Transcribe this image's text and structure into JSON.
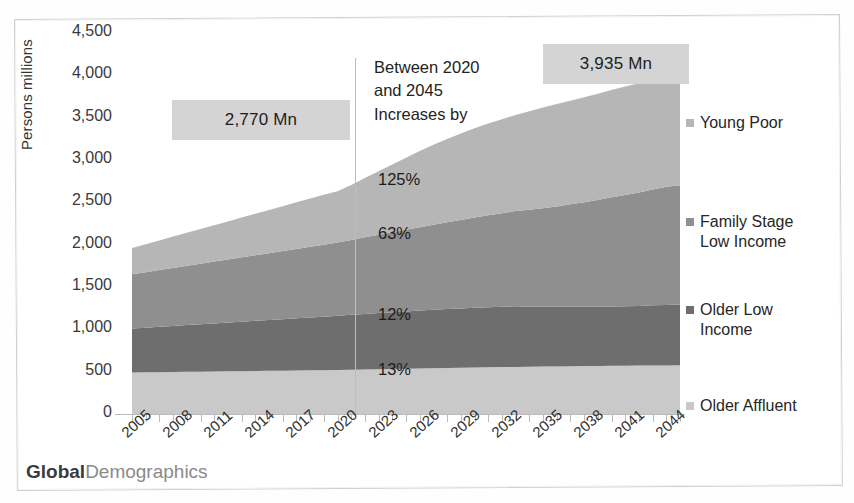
{
  "brand": {
    "bold": "Global",
    "light": "Demographics"
  },
  "callouts": [
    {
      "id": "start-total",
      "text": "2,770 Mn"
    },
    {
      "id": "end-total",
      "text": "3,935 Mn"
    }
  ],
  "annotation": {
    "line1": "Between 2020",
    "line2": "and 2045",
    "line3": "Increases by"
  },
  "legend": {
    "items": [
      {
        "label": "Young Poor",
        "color": "#b6b6b6"
      },
      {
        "label": "Family Stage Low Income",
        "color": "#8f8f8f"
      },
      {
        "label": "Older Low Income",
        "color": "#6e6e6e"
      },
      {
        "label": "Older Affluent",
        "color": "#c9c9c9"
      }
    ]
  },
  "chart_data": {
    "type": "area",
    "stacked": true,
    "title": "",
    "xlabel": "",
    "ylabel": "Persons millions",
    "ylim": [
      0,
      4500
    ],
    "ytick_labels": [
      "4,500",
      "4,000",
      "3,500",
      "3,000",
      "2,500",
      "2,000",
      "1,500",
      "1,000",
      "500",
      "0"
    ],
    "ytick_values": [
      4500,
      4000,
      3500,
      3000,
      2500,
      2000,
      1500,
      1000,
      500,
      0
    ],
    "grid": false,
    "legend_position": "right",
    "x": [
      2005,
      2006,
      2007,
      2008,
      2009,
      2010,
      2011,
      2012,
      2013,
      2014,
      2015,
      2016,
      2017,
      2018,
      2019,
      2020,
      2021,
      2022,
      2023,
      2024,
      2025,
      2026,
      2027,
      2028,
      2029,
      2030,
      2031,
      2032,
      2033,
      2034,
      2035,
      2036,
      2037,
      2038,
      2039,
      2040,
      2041,
      2042,
      2043,
      2044,
      2045
    ],
    "xtick_labels": [
      "2005",
      "2008",
      "2011",
      "2014",
      "2017",
      "2020",
      "2023",
      "2026",
      "2029",
      "2032",
      "2035",
      "2038",
      "2041",
      "2044"
    ],
    "xtick_values": [
      2005,
      2008,
      2011,
      2014,
      2017,
      2020,
      2023,
      2026,
      2029,
      2032,
      2035,
      2038,
      2041,
      2044
    ],
    "series": [
      {
        "name": "Older Affluent",
        "color": "#c9c9c9",
        "values": [
          490,
          492,
          494,
          496,
          498,
          500,
          502,
          504,
          506,
          508,
          510,
          512,
          514,
          516,
          518,
          520,
          523,
          526,
          529,
          532,
          535,
          538,
          541,
          544,
          547,
          550,
          552,
          554,
          556,
          558,
          560,
          562,
          564,
          566,
          568,
          570,
          571,
          572,
          573,
          574,
          575
        ]
      },
      {
        "name": "Older Low Income",
        "color": "#6e6e6e",
        "values": [
          520,
          528,
          536,
          544,
          552,
          560,
          568,
          576,
          584,
          592,
          600,
          608,
          616,
          624,
          632,
          640,
          648,
          656,
          663,
          670,
          677,
          683,
          689,
          695,
          700,
          705,
          709,
          713,
          716,
          709,
          706,
          704,
          702,
          700,
          700,
          700,
          702,
          704,
          710,
          714,
          717
        ]
      },
      {
        "name": "Family Stage Low Income",
        "color": "#8f8f8f",
        "values": [
          640,
          655,
          670,
          685,
          700,
          715,
          730,
          745,
          760,
          775,
          790,
          805,
          820,
          835,
          850,
          865,
          885,
          905,
          925,
          945,
          965,
          985,
          1005,
          1025,
          1045,
          1065,
          1085,
          1105,
          1125,
          1145,
          1165,
          1185,
          1210,
          1235,
          1260,
          1290,
          1315,
          1340,
          1368,
          1395,
          1410
        ]
      },
      {
        "name": "Young Poor",
        "color": "#b6b6b6",
        "values": [
          310,
          330,
          350,
          370,
          390,
          410,
          430,
          450,
          470,
          490,
          510,
          530,
          550,
          570,
          590,
          605,
          650,
          700,
          750,
          800,
          850,
          900,
          945,
          985,
          1020,
          1055,
          1085,
          1110,
          1135,
          1165,
          1190,
          1210,
          1225,
          1240,
          1255,
          1268,
          1280,
          1290,
          1300,
          1310,
          1233
        ]
      }
    ],
    "totals": {
      "2005": 1960,
      "2020": 2770,
      "2045": 3935
    },
    "growth_labels": [
      {
        "series": "Young Poor",
        "value": "125%"
      },
      {
        "series": "Family Stage Low Income",
        "value": "63%"
      },
      {
        "series": "Older Low Income",
        "value": "12%"
      },
      {
        "series": "Older Affluent",
        "value": "13%"
      }
    ]
  }
}
